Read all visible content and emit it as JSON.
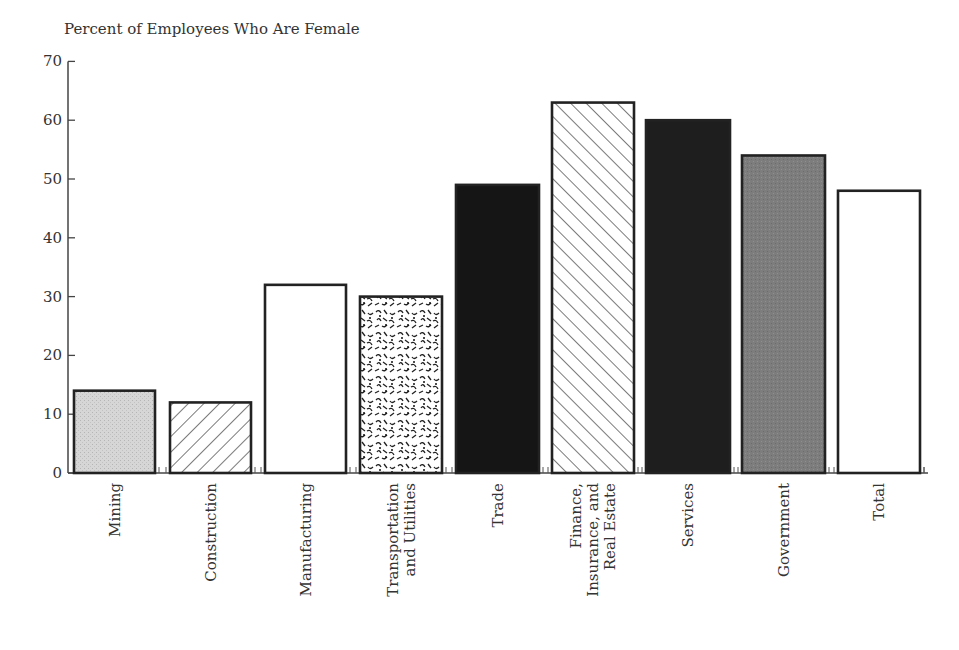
{
  "chart_data": {
    "type": "bar",
    "title": "Percent of Employees Who Are Female",
    "xlabel": "",
    "ylabel": "Percent of Employees Who Are Female",
    "ylim": [
      0,
      70
    ],
    "yticks": [
      0,
      10,
      20,
      30,
      40,
      50,
      60,
      70
    ],
    "grid": false,
    "legend": "none",
    "categories": [
      "Mining",
      "Construction",
      "Manufacturing",
      "Transportation and Utilities",
      "Trade",
      "Finance, Insurance, and Real Estate",
      "Services",
      "Government",
      "Total"
    ],
    "category_label_lines": [
      [
        "Mining"
      ],
      [
        "Construction"
      ],
      [
        "Manufacturing"
      ],
      [
        "Transportation",
        "and Utilities"
      ],
      [
        "Trade"
      ],
      [
        "Finance,",
        "Insurance, and",
        "Real Estate"
      ],
      [
        "Services"
      ],
      [
        "Government"
      ],
      [
        "Total"
      ]
    ],
    "values": [
      14,
      12,
      32,
      30,
      49,
      63,
      60,
      54,
      48
    ],
    "fills": [
      "light-gray-stipple",
      "diagonal-hatch-down",
      "white",
      "squiggle-texture",
      "black",
      "diagonal-hatch-up",
      "near-black",
      "medium-gray",
      "white"
    ]
  },
  "colors": {
    "axis": "#444444",
    "bar_outline": "#222222",
    "mining_fill": "#d4d4d4",
    "trade_fill": "#151515",
    "services_fill": "#1e1e1e",
    "government_fill": "#7a7a7a"
  }
}
